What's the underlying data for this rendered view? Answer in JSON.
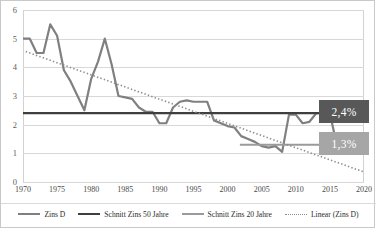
{
  "chart_data": {
    "type": "line",
    "title": "",
    "xlabel": "",
    "ylabel": "",
    "xlim": [
      1970,
      2020
    ],
    "ylim": [
      0,
      6
    ],
    "grid": true,
    "legend_position": "bottom",
    "y_ticks": [
      "6",
      "5",
      "4",
      "3",
      "2",
      "1",
      "0"
    ],
    "y_tick_values": [
      6,
      5,
      4,
      3,
      2,
      1,
      0
    ],
    "x_ticks": [
      "1970",
      "1975",
      "1980",
      "1985",
      "1990",
      "1995",
      "2000",
      "2005",
      "2010",
      "2015",
      "2020"
    ],
    "x_tick_values": [
      1970,
      1975,
      1980,
      1985,
      1990,
      1995,
      2000,
      2005,
      2010,
      2015,
      2020
    ],
    "x": [
      1970,
      1971,
      1972,
      1973,
      1974,
      1975,
      1976,
      1977,
      1978,
      1979,
      1980,
      1981,
      1982,
      1983,
      1984,
      1985,
      1986,
      1987,
      1988,
      1989,
      1990,
      1991,
      1992,
      1993,
      1994,
      1995,
      1996,
      1997,
      1998,
      1999,
      2000,
      2001,
      2002,
      2003,
      2004,
      2005,
      2006,
      2007,
      2008,
      2009,
      2010,
      2011,
      2012,
      2013,
      2014,
      2015,
      2016,
      2017,
      2018,
      2019,
      2020
    ],
    "series": [
      {
        "name": "Zins D",
        "color": "#808080",
        "style": "solid",
        "width": 2.2,
        "values": [
          5.0,
          5.0,
          4.5,
          4.5,
          5.5,
          5.1,
          3.9,
          3.5,
          3.0,
          2.5,
          3.6,
          4.2,
          5.0,
          4.1,
          3.0,
          2.95,
          2.9,
          2.6,
          2.45,
          2.45,
          2.05,
          2.05,
          2.6,
          2.8,
          2.85,
          2.8,
          2.8,
          2.8,
          2.15,
          2.05,
          1.95,
          1.9,
          1.6,
          1.5,
          1.4,
          1.25,
          1.2,
          1.25,
          1.05,
          2.35,
          2.35,
          2.05,
          2.1,
          2.4,
          2.4,
          2.4,
          1.3,
          1.35,
          1.4,
          1.5,
          1.4
        ]
      },
      {
        "name": "Schnitt Zins 50 Jahre",
        "color": "#3f3f3f",
        "style": "solid",
        "width": 2.2,
        "constant": 2.4,
        "x_start": 1970,
        "x_end": 2020
      },
      {
        "name": "Schnitt Zins 20 Jahre",
        "color": "#9a9a9a",
        "style": "solid",
        "width": 2.0,
        "constant": 1.3,
        "x_start": 2001.8,
        "x_end": 2020
      },
      {
        "name": "Linear (Zins D)",
        "color": "#8d8d8d",
        "style": "dotted",
        "width": 1.6,
        "y_start": 4.55,
        "y_end": 0.35,
        "x_start": 1970.4,
        "x_end": 2020
      }
    ],
    "tail_values_after_2015": [
      1.1,
      0.65,
      0.35,
      0.2,
      0.12,
      0.1
    ],
    "annotations": [
      {
        "name": "schnitt-50-label",
        "text": "2,4%",
        "value": 2.4,
        "bg": "#585858",
        "fg": "#ffffff"
      },
      {
        "name": "schnitt-20-label",
        "text": "1,3%",
        "value": 1.3,
        "bg": "#a6a6a6",
        "fg": "#ffffff"
      }
    ]
  },
  "legend": {
    "items": [
      {
        "label": "Zins D",
        "swatch": "sw-zins"
      },
      {
        "label": "Schnitt Zins 50 Jahre",
        "swatch": "sw-50"
      },
      {
        "label": "Schnitt Zins 20 Jahre",
        "swatch": "sw-20"
      },
      {
        "label": "Linear (Zins D)",
        "swatch": "sw-lin"
      }
    ]
  },
  "callouts": {
    "avg50": "2,4%",
    "avg20": "1,3%"
  }
}
